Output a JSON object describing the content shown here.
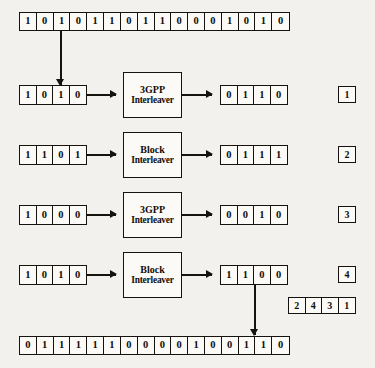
{
  "diagram": {
    "colors": {
      "ink": "#16130f",
      "paper": "#f2f1ee",
      "cell_fill": "#fbfaf7"
    },
    "top_register": {
      "name": "input-bit-stream",
      "bits": [
        "1",
        "0",
        "1",
        "0",
        "1",
        "1",
        "0",
        "1",
        "1",
        "0",
        "0",
        "0",
        "1",
        "0",
        "1",
        "0"
      ]
    },
    "rows": [
      {
        "index_label": "1",
        "input_bits": [
          "1",
          "0",
          "1",
          "0"
        ],
        "processor": {
          "line1": "3GPP",
          "line2": "Interleaver"
        },
        "output_bits": [
          "0",
          "1",
          "1",
          "0"
        ]
      },
      {
        "index_label": "2",
        "input_bits": [
          "1",
          "1",
          "0",
          "1"
        ],
        "processor": {
          "line1": "Block",
          "line2": "Interleaver"
        },
        "output_bits": [
          "0",
          "1",
          "1",
          "1"
        ]
      },
      {
        "index_label": "3",
        "input_bits": [
          "1",
          "0",
          "0",
          "0"
        ],
        "processor": {
          "line1": "3GPP",
          "line2": "Interleaver"
        },
        "output_bits": [
          "0",
          "0",
          "1",
          "0"
        ]
      },
      {
        "index_label": "4",
        "input_bits": [
          "1",
          "0",
          "1",
          "0"
        ],
        "processor": {
          "line1": "Block",
          "line2": "Interleaver"
        },
        "output_bits": [
          "1",
          "1",
          "0",
          "0"
        ]
      }
    ],
    "permutation_register": {
      "name": "permutation-order",
      "values": [
        "2",
        "4",
        "3",
        "1"
      ]
    },
    "bottom_register": {
      "name": "output-bit-stream",
      "bits": [
        "0",
        "1",
        "1",
        "1",
        "1",
        "1",
        "0",
        "0",
        "0",
        "0",
        "1",
        "0",
        "0",
        "1",
        "1",
        "0"
      ]
    }
  }
}
